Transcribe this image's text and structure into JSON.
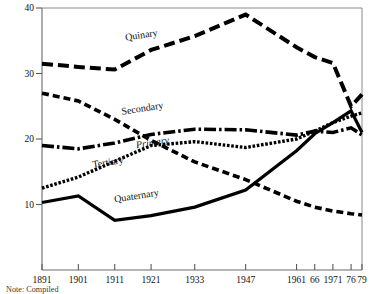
{
  "chart_data": {
    "type": "line",
    "title": "",
    "subtitle": "",
    "xlabel": "",
    "ylabel": "",
    "xlim": [
      1891,
      1979
    ],
    "ylim": [
      0,
      40
    ],
    "grid": false,
    "legend_position": "inline-labels",
    "x_tick_labels": [
      "1891",
      "1901",
      "1911",
      "1921",
      "1933",
      "1947",
      "1961",
      "66",
      "1971",
      "76",
      "79"
    ],
    "x_tick_values": [
      1891,
      1901,
      1911,
      1921,
      1933,
      1947,
      1961,
      1966,
      1971,
      1976,
      1979
    ],
    "y_tick_labels": [
      "10",
      "20",
      "30",
      "40"
    ],
    "y_tick_values": [
      10,
      20,
      30,
      40
    ],
    "x": [
      1891,
      1901,
      1911,
      1921,
      1933,
      1947,
      1961,
      1966,
      1971,
      1976,
      1979
    ],
    "series": [
      {
        "name": "Quinary",
        "dash": "long-dash",
        "values": [
          31.5,
          31.0,
          30.6,
          33.6,
          35.7,
          39.0,
          34.0,
          32.5,
          31.6,
          25.0,
          26.8
        ]
      },
      {
        "name": "Secondary",
        "dash": "dash-dot",
        "values": [
          19.0,
          18.5,
          19.4,
          20.7,
          21.5,
          21.4,
          20.6,
          21.2,
          21.0,
          21.7,
          20.6
        ]
      },
      {
        "name": "Primary",
        "dash": "medium-dash",
        "values": [
          27.0,
          25.8,
          23.0,
          19.8,
          16.5,
          13.8,
          10.5,
          9.6,
          9.0,
          8.6,
          8.4
        ]
      },
      {
        "name": "Tertiary",
        "dash": "fine-dot",
        "values": [
          12.5,
          14.2,
          16.6,
          19.0,
          19.6,
          18.7,
          20.0,
          21.2,
          22.5,
          23.5,
          24.0
        ]
      },
      {
        "name": "Quaternary",
        "dash": "solid",
        "values": [
          10.3,
          11.3,
          7.6,
          8.3,
          9.6,
          12.2,
          18.2,
          20.8,
          22.5,
          24.3,
          21.0
        ]
      }
    ],
    "annotations": [
      {
        "text": "Quinary",
        "x": 1914,
        "y": 35.0,
        "style": "roman"
      },
      {
        "text": "Secondary",
        "x": 1913,
        "y": 23.7,
        "style": "roman"
      },
      {
        "text": "Primary",
        "x": 1917,
        "y": 18.6,
        "style": "italic"
      },
      {
        "text": "Tertiary",
        "x": 1905,
        "y": 15.6,
        "style": "roman"
      },
      {
        "text": "Quaternary",
        "x": 1911,
        "y": 10.3,
        "style": "roman"
      }
    ],
    "note": "Note: Compiled"
  }
}
